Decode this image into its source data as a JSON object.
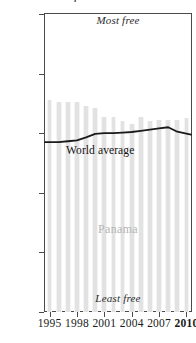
{
  "title": "Economic freedom in Panama",
  "annotations": {
    "top": "Most free",
    "bottom": "Least free",
    "series_label": "World average",
    "country_label": "Panama"
  },
  "axis": {
    "y_ticks": [
      "0",
      "20",
      "40",
      "60",
      "80",
      "100"
    ],
    "x_ticks": [
      "1995",
      "1998",
      "2001",
      "2004",
      "2007",
      "2010"
    ]
  },
  "colors": {
    "bar": "#e2e2e2",
    "line": "#1a1a1a",
    "axis": "#4a4a4a",
    "country_label": "#b5b5b5"
  },
  "chart_data": {
    "type": "bar",
    "title": "Economic freedom in Panama",
    "xlabel": "",
    "ylabel": "",
    "ylim": [
      0,
      100
    ],
    "grid": false,
    "legend": "inline-labels",
    "categories": [
      "1995",
      "1996",
      "1997",
      "1998",
      "1999",
      "2000",
      "2001",
      "2002",
      "2003",
      "2004",
      "2005",
      "2006",
      "2007",
      "2008",
      "2009",
      "2010"
    ],
    "series": [
      {
        "name": "Panama",
        "type": "bar",
        "values": [
          71,
          70.5,
          70.5,
          70.5,
          69,
          68.5,
          65.5,
          65.5,
          64,
          63,
          65.5,
          64,
          64.5,
          64.5,
          64.5,
          65
        ]
      },
      {
        "name": "World average",
        "type": "line",
        "values": [
          57,
          57,
          57.3,
          57.6,
          58.6,
          59.8,
          60,
          60,
          60.2,
          60.4,
          60.8,
          61.2,
          61.6,
          62,
          60.5,
          59.5
        ]
      }
    ]
  }
}
